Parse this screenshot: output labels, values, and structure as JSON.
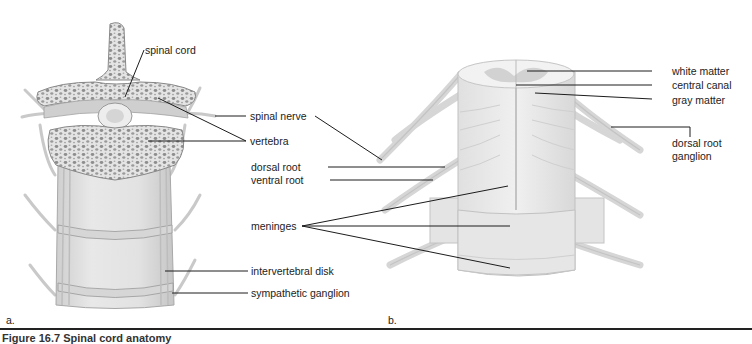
{
  "figure": {
    "caption": "Figure 16.7 Spinal cord anatomy",
    "panels": [
      {
        "letter": "a.",
        "description": "Cross-section of vertebral column with spinal cord"
      },
      {
        "letter": "b.",
        "description": "Spinal cord segment with nerve roots and meninges"
      }
    ]
  },
  "labels": {
    "spinal_cord": "spinal cord",
    "spinal_nerve": "spinal nerve",
    "vertebra": "vertebra",
    "dorsal_root": "dorsal root",
    "ventral_root": "ventral root",
    "meninges": "meninges",
    "intervertebral_disk": "intervertebral disk",
    "sympathetic_ganglion": "sympathetic ganglion",
    "white_matter": "white matter",
    "central_canal": "central canal",
    "gray_matter": "gray matter",
    "dorsal_root_ganglion_line1": "dorsal root",
    "dorsal_root_ganglion_line2": "ganglion"
  },
  "colors": {
    "ink": "#1c1c1c",
    "bone_fill": "#e6e6e6",
    "bone_dark": "#9a9a9a",
    "tissue_light": "#e9e9e9",
    "tissue_mid": "#d2d2d2"
  }
}
